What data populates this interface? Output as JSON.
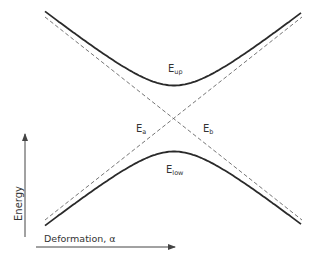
{
  "diagram": {
    "type": "avoided-crossing energy diagram",
    "labels": {
      "upper_curve": {
        "main": "E",
        "sub": "up"
      },
      "lower_curve": {
        "main": "E",
        "sub": "low"
      },
      "diabatic_a": {
        "main": "E",
        "sub": "a"
      },
      "diabatic_b": {
        "main": "E",
        "sub": "b"
      }
    },
    "axes": {
      "y_label": "Energy",
      "x_label": "Deformation, α"
    },
    "curves": [
      {
        "name": "E_up",
        "style": "solid",
        "shape": "upper branch of hyperbola"
      },
      {
        "name": "E_low",
        "style": "solid",
        "shape": "lower branch of hyperbola"
      },
      {
        "name": "E_a",
        "style": "dashed",
        "shape": "diabatic line rising left-to-right"
      },
      {
        "name": "E_b",
        "style": "dashed",
        "shape": "diabatic line falling left-to-right"
      }
    ],
    "colors": {
      "curve": "#2a2a2a",
      "dashed": "#666666",
      "axis": "#444444"
    }
  }
}
